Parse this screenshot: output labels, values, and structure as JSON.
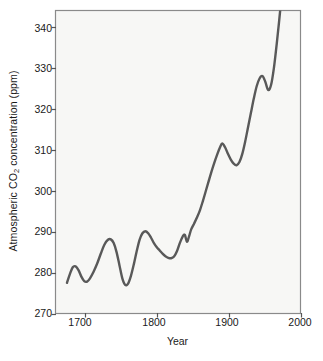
{
  "chart_data": {
    "type": "line",
    "title": "",
    "xlabel": "Year",
    "ylabel": "Atmospheric CO2 concentration (ppm)",
    "ylabel_parts": {
      "pre": "Atmospheric CO",
      "sub": "2",
      "post": " concentration (ppm)"
    },
    "xlim": [
      1659,
      2000
    ],
    "ylim": [
      270,
      344
    ],
    "xticks": [
      1700,
      1800,
      1900,
      2000
    ],
    "xtick_labels": [
      "1700",
      "1800",
      "1900",
      "2000"
    ],
    "yticks": [
      270,
      280,
      290,
      300,
      310,
      320,
      330,
      340
    ],
    "ytick_labels": [
      "270",
      "280",
      "290",
      "300",
      "310",
      "320",
      "330",
      "340"
    ],
    "grid": false,
    "legend": null,
    "series": [
      {
        "name": "Atmospheric CO2",
        "color": "#595959",
        "line_width": 2.4,
        "x": [
          1675,
          1679,
          1683,
          1687,
          1691,
          1695,
          1699,
          1703,
          1707,
          1712,
          1717,
          1722,
          1727,
          1732,
          1736,
          1740,
          1744,
          1748,
          1752,
          1756,
          1760,
          1764,
          1768,
          1772,
          1776,
          1780,
          1784,
          1788,
          1792,
          1796,
          1800,
          1804,
          1808,
          1812,
          1816,
          1820,
          1824,
          1828,
          1832,
          1836,
          1839,
          1842,
          1845,
          1848,
          1852,
          1856,
          1860,
          1864,
          1868,
          1872,
          1876,
          1880,
          1884,
          1888,
          1891,
          1895,
          1899,
          1903,
          1907,
          1911,
          1915,
          1919,
          1923,
          1927,
          1931,
          1935,
          1939,
          1943,
          1947,
          1951,
          1955,
          1959,
          1963,
          1967,
          1970,
          1972
        ],
        "y": [
          277.5,
          279.6,
          281.3,
          281.5,
          280.6,
          279.0,
          277.9,
          277.8,
          278.6,
          280.2,
          282.2,
          284.6,
          286.8,
          288.0,
          288.1,
          287.2,
          285.0,
          281.8,
          278.6,
          277.0,
          277.3,
          279.2,
          282.0,
          285.2,
          288.0,
          289.6,
          290.1,
          289.6,
          288.5,
          287.2,
          286.2,
          285.4,
          284.6,
          284.0,
          283.6,
          283.5,
          283.9,
          285.2,
          287.2,
          288.8,
          289.2,
          287.5,
          288.9,
          290.6,
          292.0,
          293.5,
          295.2,
          297.4,
          299.8,
          302.2,
          304.6,
          306.8,
          308.8,
          310.6,
          311.5,
          310.6,
          309.0,
          307.6,
          306.6,
          306.2,
          307.0,
          309.0,
          312.0,
          315.5,
          319.0,
          322.5,
          325.5,
          327.4,
          328.0,
          326.6,
          324.6,
          325.8,
          330.0,
          336.0,
          341.0,
          344.5
        ]
      }
    ],
    "annotations": [],
    "notable_points": {
      "start": {
        "year": 1675,
        "ppm": 277.5
      },
      "peak_1687": {
        "year": 1687,
        "ppm": 281.5
      },
      "trough_1703": {
        "year": 1703,
        "ppm": 277.8
      },
      "peak_1736": {
        "year": 1736,
        "ppm": 288.1
      },
      "trough_1756": {
        "year": 1756,
        "ppm": 277.0
      },
      "peak_1784": {
        "year": 1784,
        "ppm": 290.1
      },
      "trough_1820": {
        "year": 1820,
        "ppm": 283.5
      },
      "peak_1839": {
        "year": 1839,
        "ppm": 289.2
      },
      "dip_1842": {
        "year": 1842,
        "ppm": 287.5
      },
      "peak_1891": {
        "year": 1891,
        "ppm": 311.5
      },
      "trough_1911": {
        "year": 1911,
        "ppm": 306.2
      },
      "peak_1947": {
        "year": 1947,
        "ppm": 328.0
      },
      "dip_1955": {
        "year": 1955,
        "ppm": 324.6
      },
      "end": {
        "year": 1972,
        "ppm": 344.5
      }
    }
  },
  "axes": {
    "plot_bg": "#f7f7f5",
    "frame_color": "#8a8a8a",
    "tick_color": "#555555",
    "text_color": "#1a1a1a"
  }
}
